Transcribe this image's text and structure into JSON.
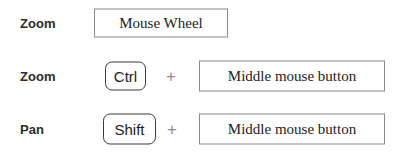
{
  "legend": {
    "title": "Mouse and keyboard navigation shortcuts",
    "separator_symbol": "+",
    "colors": {
      "background": "#ffffff",
      "label_text": "#2b2b2b",
      "box_text": "#1c1c1c",
      "box_border": "#8a8a8a",
      "keycap_border": "#3a3a3a",
      "plus_symbol": "#8d8d8d"
    },
    "rows": [
      {
        "action": "Zoom",
        "key": null,
        "separator": null,
        "input": "Mouse Wheel"
      },
      {
        "action": "Zoom",
        "key": "Ctrl",
        "separator": "+",
        "input": "Middle mouse button"
      },
      {
        "action": "Pan",
        "key": "Shift",
        "separator": "+",
        "input": "Middle mouse button"
      }
    ]
  }
}
